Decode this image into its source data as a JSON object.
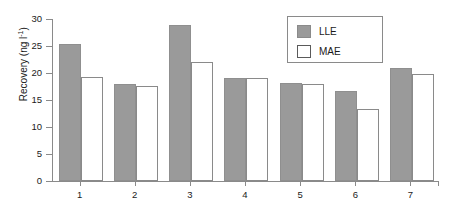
{
  "chart_data": {
    "type": "bar",
    "title": "",
    "xlabel": "",
    "ylabel": "Recovery (ng l",
    "ylabel_sup": "-1",
    "ylabel_tail": ")",
    "categories": [
      "1",
      "2",
      "3",
      "4",
      "5",
      "6",
      "7"
    ],
    "series": [
      {
        "name": "LLE",
        "color": "#9a9a9a",
        "values": [
          25.3,
          17.9,
          28.9,
          19.1,
          18.2,
          16.6,
          21.0
        ]
      },
      {
        "name": "MAE",
        "color": "#ffffff",
        "values": [
          19.2,
          17.6,
          22.1,
          19.0,
          18.0,
          13.3,
          19.9
        ]
      }
    ],
    "ylim": [
      0,
      30
    ],
    "yticks": [
      "0",
      "5",
      "10",
      "15",
      "20",
      "25",
      "30"
    ],
    "ytick_values": [
      0,
      5,
      10,
      15,
      20,
      25,
      30
    ],
    "grid": false,
    "legend_position": "top-right"
  }
}
